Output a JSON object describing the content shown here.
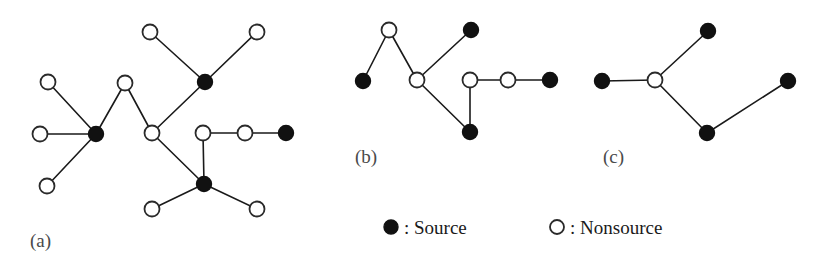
{
  "figure": {
    "width": 839,
    "height": 265,
    "background": "#ffffff",
    "edge_color": "#1a1a1a",
    "source_color": "#111111",
    "nonsource_color": "#ffffff",
    "node_radius": 7.5
  },
  "panels": [
    {
      "id": "a",
      "label": "(a)",
      "label_x": 30,
      "label_y": 247,
      "nodes": [
        {
          "id": "a1",
          "type": "nonsource",
          "x": 150,
          "y": 32
        },
        {
          "id": "a2",
          "type": "nonsource",
          "x": 257,
          "y": 32
        },
        {
          "id": "a3",
          "type": "source",
          "x": 205,
          "y": 82
        },
        {
          "id": "a4",
          "type": "nonsource",
          "x": 48,
          "y": 82
        },
        {
          "id": "a5",
          "type": "nonsource",
          "x": 125,
          "y": 83
        },
        {
          "id": "a6",
          "type": "nonsource",
          "x": 40,
          "y": 134
        },
        {
          "id": "a7",
          "type": "source",
          "x": 96,
          "y": 134
        },
        {
          "id": "a8",
          "type": "nonsource",
          "x": 152,
          "y": 133
        },
        {
          "id": "a9",
          "type": "nonsource",
          "x": 203,
          "y": 133
        },
        {
          "id": "a10",
          "type": "nonsource",
          "x": 245,
          "y": 133
        },
        {
          "id": "a11",
          "type": "source",
          "x": 286,
          "y": 133
        },
        {
          "id": "a12",
          "type": "nonsource",
          "x": 47,
          "y": 186
        },
        {
          "id": "a13",
          "type": "source",
          "x": 204,
          "y": 184
        },
        {
          "id": "a14",
          "type": "nonsource",
          "x": 152,
          "y": 209
        },
        {
          "id": "a15",
          "type": "nonsource",
          "x": 257,
          "y": 209
        }
      ],
      "edges": [
        [
          "a1",
          "a3"
        ],
        [
          "a2",
          "a3"
        ],
        [
          "a3",
          "a8"
        ],
        [
          "a4",
          "a7"
        ],
        [
          "a6",
          "a7"
        ],
        [
          "a12",
          "a7"
        ],
        [
          "a7",
          "a5"
        ],
        [
          "a5",
          "a8"
        ],
        [
          "a8",
          "a13"
        ],
        [
          "a9",
          "a10"
        ],
        [
          "a10",
          "a11"
        ],
        [
          "a9",
          "a13"
        ],
        [
          "a13",
          "a14"
        ],
        [
          "a13",
          "a15"
        ]
      ]
    },
    {
      "id": "b",
      "label": "(b)",
      "label_x": 355,
      "label_y": 163,
      "nodes": [
        {
          "id": "b1",
          "type": "nonsource",
          "x": 389,
          "y": 30
        },
        {
          "id": "b2",
          "type": "source",
          "x": 471,
          "y": 30
        },
        {
          "id": "b3",
          "type": "source",
          "x": 363,
          "y": 81
        },
        {
          "id": "b4",
          "type": "nonsource",
          "x": 417,
          "y": 80
        },
        {
          "id": "b5",
          "type": "nonsource",
          "x": 470,
          "y": 80
        },
        {
          "id": "b6",
          "type": "nonsource",
          "x": 508,
          "y": 80
        },
        {
          "id": "b7",
          "type": "source",
          "x": 550,
          "y": 80
        },
        {
          "id": "b8",
          "type": "source",
          "x": 470,
          "y": 132
        }
      ],
      "edges": [
        [
          "b1",
          "b3"
        ],
        [
          "b1",
          "b4"
        ],
        [
          "b4",
          "b2"
        ],
        [
          "b4",
          "b8"
        ],
        [
          "b5",
          "b6"
        ],
        [
          "b6",
          "b7"
        ],
        [
          "b5",
          "b8"
        ]
      ]
    },
    {
      "id": "c",
      "label": "(c)",
      "label_x": 603,
      "label_y": 163,
      "nodes": [
        {
          "id": "c1",
          "type": "source",
          "x": 602,
          "y": 81
        },
        {
          "id": "c2",
          "type": "nonsource",
          "x": 655,
          "y": 80
        },
        {
          "id": "c3",
          "type": "source",
          "x": 708,
          "y": 31
        },
        {
          "id": "c4",
          "type": "source",
          "x": 707,
          "y": 133
        },
        {
          "id": "c5",
          "type": "source",
          "x": 788,
          "y": 81
        }
      ],
      "edges": [
        [
          "c1",
          "c2"
        ],
        [
          "c2",
          "c3"
        ],
        [
          "c2",
          "c4"
        ],
        [
          "c4",
          "c5"
        ]
      ]
    }
  ],
  "legend": {
    "items": [
      {
        "marker": "filled-circle-icon",
        "type": "source",
        "text": ": Source",
        "marker_x": 391,
        "marker_y": 227,
        "text_x": 404,
        "text_y": 234
      },
      {
        "marker": "open-circle-icon",
        "type": "nonsource",
        "text": ": Nonsource",
        "marker_x": 557,
        "marker_y": 227,
        "text_x": 570,
        "text_y": 234
      }
    ]
  }
}
